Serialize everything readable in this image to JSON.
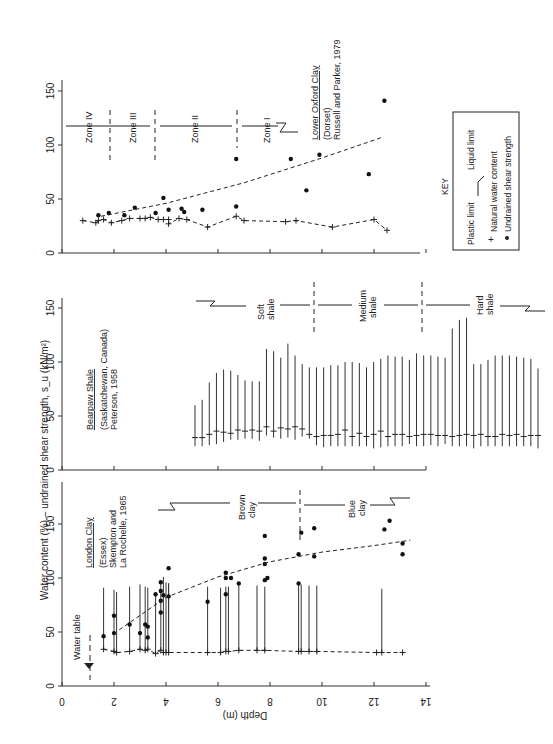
{
  "figure": {
    "orientation": "rotated-90",
    "ylabel": "Water content (%) – undrained shear strength, s_u (kN/m²)",
    "xlabel": "Depth (m)",
    "x_ticks": [
      "0",
      "2",
      "4",
      "6",
      "8",
      "10",
      "12",
      "14"
    ],
    "y_ticks": [
      "0",
      "50",
      "100",
      "150"
    ]
  },
  "key": {
    "title": "KEY",
    "plastic_limit": "Plastic limit",
    "liquid_limit": "Liquid limit",
    "natural_water_content": "Natural water content",
    "undrained_shear_strength": "Undrained shear strength"
  },
  "panels": {
    "london": {
      "title": "London Clay",
      "subtitle": "(Essex)",
      "ref1": "Skempton and",
      "ref2": "La Rochelle, 1965",
      "water_table": "Water table",
      "zone_brown_1": "Brown",
      "zone_brown_2": "clay",
      "zone_blue_1": "Blue",
      "zone_blue_2": "clay"
    },
    "bearpaw": {
      "title": "Bearpaw Shale",
      "subtitle": "(Saskatchewan, Canada)",
      "ref": "Peterson, 1958",
      "zone_soft_1": "Soft",
      "zone_soft_2": "shale",
      "zone_medium_1": "Medium",
      "zone_medium_2": "shale",
      "zone_hard_1": "Hard",
      "zone_hard_2": "shale"
    },
    "oxford": {
      "title": "Lower Oxford Clay",
      "subtitle": "(Dorset)",
      "ref": "Russell and Parker, 1979",
      "zone_4": "Zone IV",
      "zone_3": "Zone III",
      "zone_2": "Zone II",
      "zone_1": "Zone I",
      "label_2": "2",
      "label_III": "III",
      "label_II": "II"
    }
  },
  "chart_data": [
    {
      "type": "scatter",
      "title": "Lower Oxford Clay (Dorset) – Russell and Parker, 1979",
      "xlabel": "Depth (m)",
      "ylabel": "Water content (%) – undrained shear strength, s_u (kN/m²)",
      "xlim": [
        0,
        14
      ],
      "ylim": [
        0,
        150
      ],
      "zones": [
        {
          "name": "Zone IV",
          "from": 1.0,
          "to": 2.0
        },
        {
          "name": "Zone III",
          "from": 2.0,
          "to": 3.7
        },
        {
          "name": "Zone II",
          "from": 3.7,
          "to": 6.7
        },
        {
          "name": "Zone I",
          "from": 6.7,
          "to": 9.2
        }
      ],
      "series": [
        {
          "name": "Natural water content",
          "x": [
            0.8,
            1.3,
            1.4,
            1.6,
            1.9,
            2.3,
            2.6,
            3.0,
            3.2,
            3.4,
            3.7,
            3.9,
            4.1,
            4.1,
            4.5,
            4.8,
            5.6,
            6.7,
            7.0,
            8.6,
            9.0,
            10.4,
            12.0,
            12.5
          ],
          "y": [
            30,
            28,
            30,
            31,
            28,
            30,
            32,
            32,
            32,
            33,
            31,
            31,
            31,
            27,
            32,
            31,
            24,
            34,
            30,
            29,
            30,
            24,
            31,
            21
          ]
        },
        {
          "name": "Undrained shear strength",
          "x": [
            1.4,
            1.8,
            2.4,
            2.8,
            3.6,
            3.9,
            4.1,
            4.6,
            4.7,
            5.4,
            6.7,
            6.7,
            8.8,
            9.4,
            9.9,
            11.8,
            12.4
          ],
          "y": [
            35,
            37,
            35,
            42,
            37,
            51,
            40,
            41,
            38,
            40,
            43,
            87,
            87,
            58,
            91,
            73,
            141
          ]
        },
        {
          "name": "Shear strength trend",
          "x": [
            1.5,
            4.0,
            7.0,
            10.0,
            12.3
          ],
          "y": [
            34,
            46,
            65,
            88,
            107
          ]
        }
      ]
    },
    {
      "type": "range",
      "title": "Bearpaw Shale (Saskatchewan, Canada) – Peterson, 1958",
      "xlabel": "Depth (m)",
      "ylabel": "Water content (%)",
      "xlim": [
        0,
        14
      ],
      "ylim": [
        0,
        150
      ],
      "zones": [
        {
          "name": "Soft shale",
          "to": 9.7
        },
        {
          "name": "Medium shale",
          "from": 9.7,
          "to": 13.8
        },
        {
          "name": "Hard shale",
          "from": 13.8
        }
      ],
      "series": [
        {
          "name": "Plastic limit (low end)",
          "values": [
            22,
            22,
            23,
            24,
            26,
            28,
            28,
            29,
            29,
            27,
            32,
            30,
            29,
            30,
            28,
            31,
            29,
            23,
            21,
            22,
            22,
            22,
            22,
            22,
            22,
            20,
            21,
            22,
            22,
            22,
            24,
            22,
            22,
            23,
            22,
            24,
            22,
            22,
            22,
            20,
            22,
            22,
            22,
            22,
            22,
            22,
            22,
            22,
            20
          ]
        },
        {
          "name": "Natural water content",
          "values": [
            30,
            30,
            33,
            36,
            35,
            34,
            37,
            36,
            37,
            36,
            40,
            36,
            39,
            38,
            40,
            38,
            33,
            31,
            32,
            32,
            33,
            37,
            31,
            34,
            31,
            33,
            36,
            31,
            33,
            33,
            31,
            32,
            33,
            33,
            32,
            32,
            31,
            32,
            33,
            32,
            33,
            31,
            31,
            33,
            32,
            33,
            31,
            32,
            32
          ]
        },
        {
          "name": "Liquid limit (high end)",
          "values": [
            60,
            65,
            81,
            90,
            93,
            92,
            88,
            83,
            82,
            82,
            112,
            110,
            104,
            117,
            106,
            98,
            95,
            95,
            95,
            97,
            97,
            100,
            100,
            99,
            95,
            100,
            103,
            106,
            105,
            105,
            102,
            108,
            106,
            106,
            105,
            104,
            131,
            139,
            141,
            98,
            98,
            102,
            106,
            106,
            106,
            105,
            104,
            103,
            94
          ]
        }
      ]
    },
    {
      "type": "range",
      "title": "London Clay (Essex) – Skempton and La Rochelle, 1965",
      "xlabel": "Depth (m)",
      "ylabel": "Water content (%) – undrained shear strength, s_u (kN/m²)",
      "xlim": [
        0,
        14
      ],
      "ylim": [
        0,
        150
      ],
      "water_table_depth": 1.1,
      "zones": [
        {
          "name": "Brown clay",
          "to": 9.1
        },
        {
          "name": "Blue clay",
          "from": 9.1
        }
      ],
      "series": [
        {
          "name": "Liquid limit range",
          "x": [
            1.6,
            2.0,
            2.1,
            2.6,
            3.0,
            3.2,
            3.3,
            3.6,
            3.8,
            3.9,
            4.0,
            4.1,
            4.1,
            5.6,
            6.1,
            6.3,
            6.4,
            6.8,
            7.5,
            7.8,
            9.1,
            9.2,
            9.5,
            9.8,
            12.3
          ],
          "y_top": [
            91,
            89,
            87,
            92,
            94,
            92,
            91,
            86,
            96,
            101,
            96,
            95,
            95,
            92,
            91,
            92,
            92,
            95,
            93,
            92,
            96,
            94,
            93,
            93,
            90
          ]
        },
        {
          "name": "Natural water content / plastic limit",
          "x": [
            1.6,
            2.0,
            2.1,
            2.6,
            3.0,
            3.2,
            3.3,
            3.6,
            3.8,
            3.9,
            4.0,
            4.1,
            5.6,
            6.1,
            6.3,
            6.4,
            6.8,
            7.5,
            7.8,
            9.1,
            9.2,
            9.5,
            9.8,
            12.1,
            12.3,
            13.1
          ],
          "y": [
            34,
            32,
            31,
            32,
            34,
            33,
            34,
            30,
            33,
            31,
            31,
            31,
            31,
            31,
            32,
            32,
            33,
            33,
            33,
            32,
            32,
            32,
            32,
            31,
            31,
            31
          ]
        },
        {
          "name": "Undrained shear strength",
          "x": [
            1.6,
            2.0,
            2.0,
            2.6,
            3.0,
            3.2,
            3.3,
            3.3,
            3.6,
            3.8,
            3.8,
            3.8,
            3.8,
            3.9,
            4.1,
            4.1,
            5.6,
            6.3,
            6.3,
            6.3,
            6.5,
            6.8,
            7.8,
            7.8,
            7.8,
            7.8,
            7.9,
            9.1,
            9.1,
            9.2,
            9.7,
            9.7,
            12.4,
            12.6,
            13.1,
            13.1
          ],
          "y": [
            46,
            65,
            49,
            57,
            49,
            57,
            55,
            45,
            85,
            96,
            88,
            79,
            68,
            84,
            109,
            83,
            78,
            105,
            100,
            85,
            100,
            95,
            139,
            118,
            113,
            98,
            100,
            95,
            122,
            142,
            120,
            146,
            145,
            153,
            132,
            122
          ]
        },
        {
          "name": "Shear strength trend",
          "x": [
            2.2,
            4.0,
            6.0,
            8.0,
            10.0,
            12.0,
            13.4
          ],
          "y": [
            52,
            82,
            101,
            115,
            124,
            130,
            135
          ]
        }
      ]
    }
  ]
}
